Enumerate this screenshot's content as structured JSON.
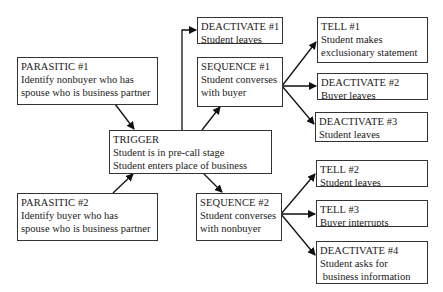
{
  "diagram": {
    "type": "flow",
    "nodes": [
      {
        "id": "parasitic1",
        "title": "PARASITIC #1",
        "lines": [
          "Identify nonbuyer who has",
          "spouse who is business partner"
        ]
      },
      {
        "id": "parasitic2",
        "title": "PARASITIC #2",
        "lines": [
          "Identify buyer who has",
          "spouse who is business partner"
        ]
      },
      {
        "id": "trigger",
        "title": "TRIGGER",
        "lines": [
          "Student is in pre-call stage",
          "Student enters place of business"
        ]
      },
      {
        "id": "deactivate1",
        "title": "DEACTIVATE #1",
        "lines": [
          "Student leaves"
        ]
      },
      {
        "id": "sequence1",
        "title": "SEQUENCE #1",
        "lines": [
          "Student converses",
          "with buyer"
        ]
      },
      {
        "id": "sequence2",
        "title": "SEQUENCE #2",
        "lines": [
          "Student converses",
          "with nonbuyer"
        ]
      },
      {
        "id": "tell1",
        "title": "TELL #1",
        "lines": [
          "Student makes",
          "exclusionary statement"
        ]
      },
      {
        "id": "deactivate2",
        "title": "DEACTIVATE #2",
        "lines": [
          "Buyer leaves"
        ]
      },
      {
        "id": "deactivate3",
        "title": "DEACTIVATE #3",
        "lines": [
          "Student leaves"
        ]
      },
      {
        "id": "tell2",
        "title": "TELL #2",
        "lines": [
          "Student leaves"
        ]
      },
      {
        "id": "tell3",
        "title": "TELL #3",
        "lines": [
          "Buyer interrupts"
        ]
      },
      {
        "id": "deactivate4",
        "title": "DEACTIVATE #4",
        "lines": [
          "Student asks for",
          " business information"
        ]
      }
    ],
    "edges": [
      {
        "from": "parasitic1",
        "to": "trigger"
      },
      {
        "from": "parasitic2",
        "to": "trigger"
      },
      {
        "from": "trigger",
        "to": "deactivate1"
      },
      {
        "from": "trigger",
        "to": "sequence1"
      },
      {
        "from": "trigger",
        "to": "sequence2"
      },
      {
        "from": "sequence1",
        "to": "tell1"
      },
      {
        "from": "sequence1",
        "to": "deactivate2"
      },
      {
        "from": "sequence1",
        "to": "deactivate3"
      },
      {
        "from": "sequence2",
        "to": "tell2"
      },
      {
        "from": "sequence2",
        "to": "tell3"
      },
      {
        "from": "sequence2",
        "to": "deactivate4"
      }
    ]
  }
}
